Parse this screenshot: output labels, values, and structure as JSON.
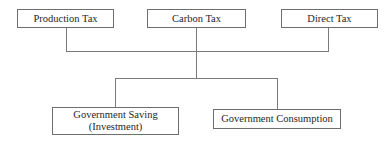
{
  "diagram": {
    "type": "flowchart",
    "top_nodes": [
      {
        "id": "production_tax",
        "label": "Production Tax"
      },
      {
        "id": "carbon_tax",
        "label": "Carbon Tax"
      },
      {
        "id": "direct_tax",
        "label": "Direct Tax"
      }
    ],
    "bottom_nodes": [
      {
        "id": "government_saving",
        "label_line1": "Government Saving",
        "label_line2": "(Investment)"
      },
      {
        "id": "government_consumption",
        "label": "Government Consumption"
      }
    ],
    "edges": [
      {
        "from": "production_tax",
        "to": "merge"
      },
      {
        "from": "carbon_tax",
        "to": "merge"
      },
      {
        "from": "direct_tax",
        "to": "merge"
      },
      {
        "from": "merge",
        "to": "government_saving"
      },
      {
        "from": "merge",
        "to": "government_consumption"
      }
    ],
    "colors": {
      "line": "#7a7a7a",
      "border": "#6e6e6e",
      "text": "#262626",
      "background": "#ffffff"
    }
  }
}
